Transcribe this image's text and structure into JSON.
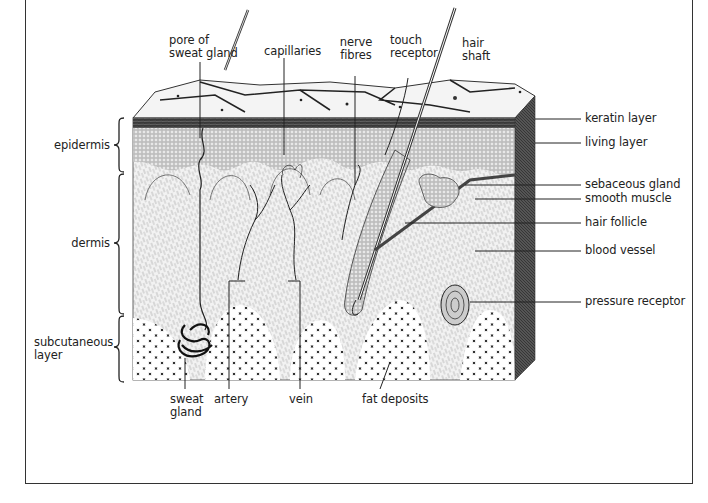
{
  "diagram": {
    "layers": [
      {
        "id": "epidermis",
        "label": "epidermis"
      },
      {
        "id": "dermis",
        "label": "dermis"
      },
      {
        "id": "subcutaneous",
        "label": "subcutaneous layer",
        "line1": "subcutaneous",
        "line2": "layer"
      }
    ],
    "top_labels": [
      {
        "id": "pore",
        "line1": "pore of",
        "line2": "sweat gland"
      },
      {
        "id": "capillaries",
        "line1": "capillaries"
      },
      {
        "id": "nerve",
        "line1": "nerve",
        "line2": "fibres"
      },
      {
        "id": "touch",
        "line1": "touch",
        "line2": "receptor"
      },
      {
        "id": "hair_shaft",
        "line1": "hair",
        "line2": "shaft"
      }
    ],
    "right_labels": [
      {
        "id": "keratin",
        "label": "keratin layer"
      },
      {
        "id": "living",
        "label": "living layer"
      },
      {
        "id": "sebaceous",
        "label": "sebaceous gland"
      },
      {
        "id": "smooth_muscle",
        "label": "smooth muscle"
      },
      {
        "id": "hair_follicle",
        "label": "hair follicle"
      },
      {
        "id": "blood_vessel",
        "label": "blood vessel"
      },
      {
        "id": "pressure",
        "label": "pressure receptor"
      }
    ],
    "bottom_labels": [
      {
        "id": "sweat_gland",
        "line1": "sweat",
        "line2": "gland"
      },
      {
        "id": "artery",
        "line1": "artery"
      },
      {
        "id": "vein",
        "line1": "vein"
      },
      {
        "id": "fat",
        "line1": "fat deposits"
      }
    ]
  }
}
